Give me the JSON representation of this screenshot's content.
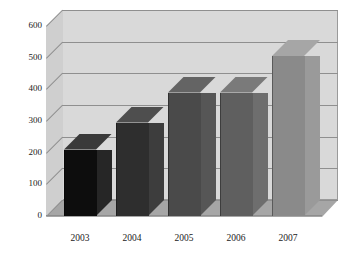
{
  "chart_data": {
    "type": "bar",
    "title": "",
    "subtitle": "",
    "xlabel": "",
    "ylabel": "",
    "categories": [
      "2003",
      "2004",
      "2005",
      "2006",
      "2007"
    ],
    "values": [
      210,
      295,
      390,
      390,
      505
    ],
    "series": [
      {
        "name": "",
        "values": [
          210,
          295,
          390,
          390,
          505
        ]
      }
    ],
    "ylim": [
      0,
      600
    ],
    "xlim": null,
    "ytick_labels": [
      "0",
      "100",
      "200",
      "300",
      "400",
      "500",
      "600"
    ],
    "ytick_values": [
      0,
      100,
      200,
      300,
      400,
      500,
      600
    ],
    "grid": true,
    "grid_axis": "y",
    "legend": false,
    "legend_position": "none",
    "style": "3d-column",
    "annotations": []
  },
  "appearance": {
    "background_color": "#ffffff",
    "wall_color": "#d9d9d9",
    "side_wall_color": "#cfcfcf",
    "floor_color": "#a6a6a6",
    "gridline_color": "#8f8f8f",
    "border_color": "#9a9a9a",
    "text_color": "#1a1a1a",
    "bar_colors_front": [
      "#0d0d0d",
      "#2e2e2e",
      "#4a4a4a",
      "#5f5f5f",
      "#8a8a8a"
    ],
    "bar_colors_side": [
      "#262626",
      "#3d3d3d",
      "#565656",
      "#6e6e6e",
      "#9a9a9a"
    ],
    "bar_colors_top": [
      "#3a3a3a",
      "#4e4e4e",
      "#646464",
      "#7a7a7a",
      "#a6a6a6"
    ]
  },
  "axis": {
    "y_ticks": [
      {
        "label": "600",
        "value": 600
      },
      {
        "label": "500",
        "value": 500
      },
      {
        "label": "400",
        "value": 400
      },
      {
        "label": "300",
        "value": 300
      },
      {
        "label": "200",
        "value": 200
      },
      {
        "label": "100",
        "value": 100
      },
      {
        "label": "0",
        "value": 0
      }
    ],
    "x_ticks": [
      {
        "label": "2003"
      },
      {
        "label": "2004"
      },
      {
        "label": "2005"
      },
      {
        "label": "2006"
      },
      {
        "label": "2007"
      }
    ]
  }
}
